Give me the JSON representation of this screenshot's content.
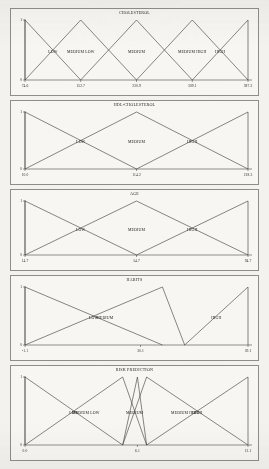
{
  "page": {
    "background_color": "#f3f2ef",
    "line_color": "#3a3735",
    "frame_color": "#8e8d89"
  },
  "chart_data": [
    {
      "type": "line",
      "title": "CHOLESTEROL",
      "xlabel": "",
      "ylabel": "",
      "ylim": [
        0,
        1
      ],
      "xlim": [
        74.6,
        387.2
      ],
      "grid": false,
      "legend": "none",
      "yticks": [
        "0",
        "1"
      ],
      "xticks": [
        "74.6",
        "152.7",
        "230.9",
        "309.1",
        "387.2"
      ],
      "xtick_values": [
        74.6,
        152.7,
        230.9,
        309.1,
        387.2
      ],
      "series": [
        {
          "name": "LOW",
          "x": [
            74.6,
            74.6,
            152.7
          ],
          "values": [
            0,
            1,
            0
          ]
        },
        {
          "name": "MEDIUM LOW",
          "x": [
            74.6,
            152.7,
            230.9
          ],
          "values": [
            0,
            1,
            0
          ]
        },
        {
          "name": "MEDIUM",
          "x": [
            152.7,
            230.9,
            309.1
          ],
          "values": [
            0,
            1,
            0
          ]
        },
        {
          "name": "MEDIUM HIGH",
          "x": [
            230.9,
            309.1,
            387.2
          ],
          "values": [
            0,
            1,
            0
          ]
        },
        {
          "name": "HIGH",
          "x": [
            309.1,
            387.2,
            387.2
          ],
          "values": [
            0,
            1,
            0
          ]
        }
      ]
    },
    {
      "type": "line",
      "title": "HDL-CHOLESTEROL",
      "xlabel": "",
      "ylabel": "",
      "ylim": [
        0,
        1
      ],
      "xlim": [
        10.0,
        218.3
      ],
      "grid": false,
      "legend": "none",
      "yticks": [
        "0",
        "1"
      ],
      "xticks": [
        "10.0",
        "114.2",
        "218.3"
      ],
      "xtick_values": [
        10.0,
        114.2,
        218.3
      ],
      "series": [
        {
          "name": "LOW",
          "x": [
            10.0,
            10.0,
            114.2
          ],
          "values": [
            0,
            1,
            0
          ]
        },
        {
          "name": "MEDIUM",
          "x": [
            10.0,
            114.2,
            218.3
          ],
          "values": [
            0,
            1,
            0
          ]
        },
        {
          "name": "HIGH",
          "x": [
            114.2,
            218.3,
            218.3
          ],
          "values": [
            0,
            1,
            0
          ]
        }
      ]
    },
    {
      "type": "line",
      "title": "AGE",
      "xlabel": "",
      "ylabel": "",
      "ylim": [
        0,
        1
      ],
      "xlim": [
        14.7,
        94.7
      ],
      "grid": false,
      "legend": "none",
      "yticks": [
        "0",
        "1"
      ],
      "xticks": [
        "14.7",
        "54.7",
        "94.7"
      ],
      "xtick_values": [
        14.7,
        54.7,
        94.7
      ],
      "series": [
        {
          "name": "LOW",
          "x": [
            14.7,
            14.7,
            54.7
          ],
          "values": [
            0,
            1,
            0
          ]
        },
        {
          "name": "MEDIUM",
          "x": [
            14.7,
            54.7,
            94.7
          ],
          "values": [
            0,
            1,
            0
          ]
        },
        {
          "name": "HIGH",
          "x": [
            54.7,
            94.7,
            94.7
          ],
          "values": [
            0,
            1,
            0
          ]
        }
      ]
    },
    {
      "type": "line",
      "title": "HABITS",
      "xlabel": "",
      "ylabel": "",
      "ylim": [
        0,
        1
      ],
      "xlim": [
        -1.1,
        59.1
      ],
      "grid": false,
      "legend": "none",
      "yticks": [
        "0",
        "1"
      ],
      "xticks": [
        "-1.1",
        "30.1",
        "59.1"
      ],
      "xtick_values": [
        -1.1,
        30.1,
        59.1
      ],
      "series": [
        {
          "name": "LOW",
          "x": [
            -1.1,
            -1.1,
            36.0
          ],
          "values": [
            0,
            1,
            0
          ]
        },
        {
          "name": "MEDIUM",
          "x": [
            -1.1,
            36.0,
            42.0
          ],
          "values": [
            0,
            1,
            0
          ]
        },
        {
          "name": "HIGH",
          "x": [
            42.0,
            59.1,
            59.1
          ],
          "values": [
            0,
            1,
            0
          ]
        }
      ]
    },
    {
      "type": "line",
      "title": "RISK PREDICTION",
      "xlabel": "",
      "ylabel": "",
      "ylim": [
        0,
        1
      ],
      "xlim": [
        0.0,
        12.1
      ],
      "grid": false,
      "legend": "none",
      "yticks": [
        "0",
        "1"
      ],
      "xticks": [
        "0.0",
        "6.1",
        "12.1"
      ],
      "xtick_values": [
        0.0,
        6.1,
        12.1
      ],
      "series": [
        {
          "name": "LOW",
          "x": [
            0.0,
            0.0,
            5.3
          ],
          "values": [
            0,
            1,
            0
          ]
        },
        {
          "name": "MEDIUM LOW",
          "x": [
            0.0,
            5.3,
            6.6
          ],
          "values": [
            0,
            1,
            0
          ]
        },
        {
          "name": "MEDIUM",
          "x": [
            5.3,
            6.1,
            6.6
          ],
          "values": [
            0,
            1,
            0
          ]
        },
        {
          "name": "MEDIUM HIGH",
          "x": [
            5.3,
            6.6,
            12.1
          ],
          "values": [
            0,
            1,
            0
          ]
        },
        {
          "name": "HIGH",
          "x": [
            6.6,
            12.1,
            12.1
          ],
          "values": [
            0,
            1,
            0
          ]
        }
      ]
    }
  ]
}
